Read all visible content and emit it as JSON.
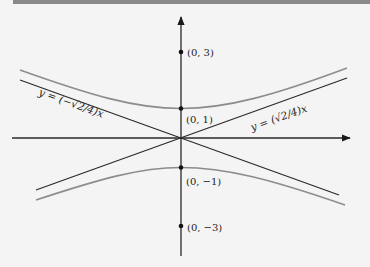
{
  "figure": {
    "type": "hyperbola-diagram",
    "equation_implied": "y^2 - x^2/8 = 1",
    "axes": {
      "x_arrow": true,
      "y_arrow": true
    },
    "points": [
      {
        "label": "(0, 3)",
        "x": 0,
        "y": 3
      },
      {
        "label": "(0, 1)",
        "x": 0,
        "y": 1
      },
      {
        "label": "(0, −1)",
        "x": 0,
        "y": -1
      },
      {
        "label": "(0, −3)",
        "x": 0,
        "y": -3
      }
    ],
    "asymptotes": [
      {
        "label": "y = (−√2/4)x",
        "slope": -0.3536
      },
      {
        "label": "y = (√2/4)x",
        "slope": 0.3536
      }
    ],
    "colors": {
      "axes": "#2a2a2a",
      "asymptotes": "#2a2a2a",
      "hyperbola": "#8c8c8c",
      "background": "#f4f4f4",
      "top_bar": "#8a8a8a"
    }
  }
}
